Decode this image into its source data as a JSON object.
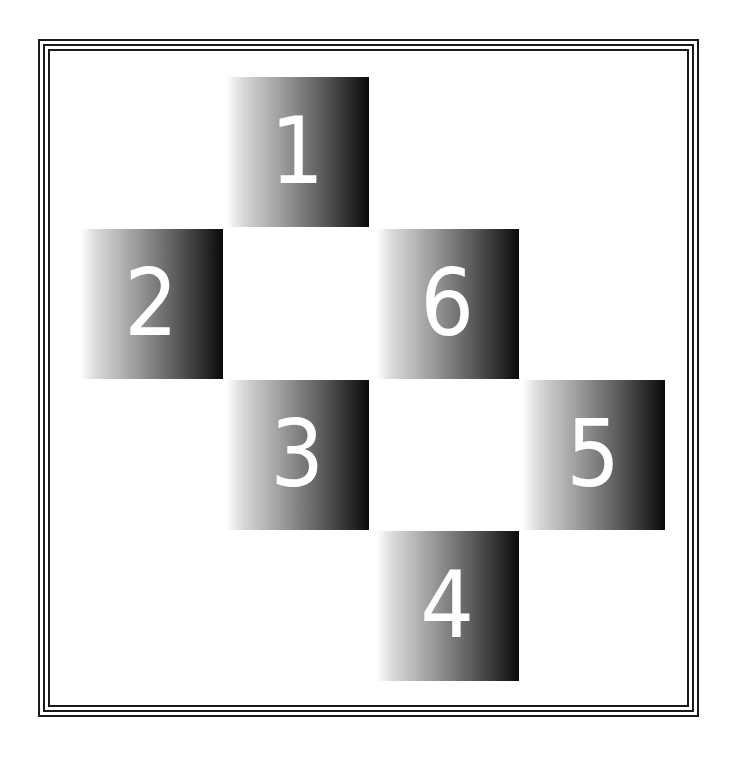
{
  "diagram": {
    "type": "numbered-tile-arrangement",
    "border": {
      "style": "triple-line",
      "color": "#1a1a1a"
    },
    "tile_style": {
      "gradient": "left-to-right",
      "from": "#ffffff",
      "to": "#0a0a0a",
      "numeral_color": "#ffffff"
    },
    "tiles": [
      {
        "label": "1",
        "col": 1,
        "row": 0
      },
      {
        "label": "2",
        "col": 0,
        "row": 1
      },
      {
        "label": "6",
        "col": 2,
        "row": 1
      },
      {
        "label": "3",
        "col": 1,
        "row": 2
      },
      {
        "label": "5",
        "col": 3,
        "row": 2
      },
      {
        "label": "4",
        "col": 2,
        "row": 3
      }
    ]
  }
}
